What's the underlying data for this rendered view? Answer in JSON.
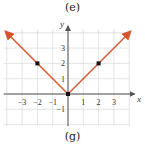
{
  "captions": {
    "top": "(e)",
    "bottom": "(g)"
  },
  "colors": {
    "line": "#d9532e",
    "point": "#111111",
    "grid": "#dddddd",
    "axis": "#555555"
  },
  "chart_data": {
    "type": "line",
    "title": "",
    "function": "y = |x|",
    "xlabel": "x",
    "ylabel": "y",
    "xlim": [
      -4.2,
      4.2
    ],
    "ylim": [
      -2,
      4
    ],
    "grid": true,
    "x_ticks": [
      -3,
      -2,
      -1,
      1,
      2,
      3
    ],
    "x_tick_labels": [
      "−3",
      "−2",
      "−1",
      "1",
      "2",
      "3"
    ],
    "y_ticks": [
      -1,
      1,
      2,
      3
    ],
    "y_tick_labels": [
      "−1",
      "1",
      "2",
      "3"
    ],
    "series": [
      {
        "name": "y=|x|",
        "x": [
          -4,
          0,
          4
        ],
        "y": [
          4,
          0,
          4
        ],
        "arrows": "both-ends"
      }
    ],
    "points": [
      {
        "x": -2,
        "y": 2
      },
      {
        "x": 0,
        "y": 0
      },
      {
        "x": 2,
        "y": 2
      }
    ]
  }
}
